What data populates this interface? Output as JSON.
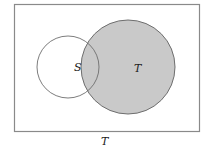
{
  "diagram": {
    "type": "venn",
    "universe_label": "T",
    "sets": [
      {
        "name": "S",
        "label": "S",
        "shaded": false
      },
      {
        "name": "T",
        "label": "T",
        "shaded": true
      }
    ],
    "colors": {
      "shade": "#c9c9c9",
      "stroke": "#6e6e6e",
      "border": "#8a8a8a"
    }
  }
}
